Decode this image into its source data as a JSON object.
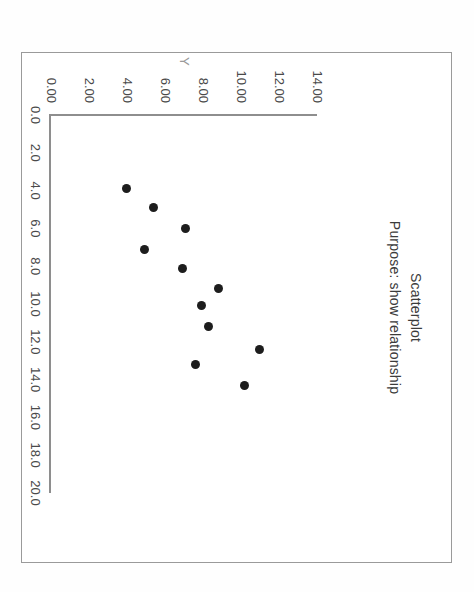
{
  "chart_data": {
    "type": "scatter",
    "title": "Scatterplot",
    "subtitle": "Purpose: show relationship",
    "xlabel": "X",
    "ylabel": "Y",
    "xlim": [
      0.0,
      20.0
    ],
    "ylim": [
      0.0,
      14.0
    ],
    "grid": false,
    "legend": null,
    "xticks": [
      "0.0",
      "2.0",
      "4.0",
      "6.0",
      "8.0",
      "10.0",
      "12.0",
      "14.0",
      "16.0",
      "18.0",
      "20.0"
    ],
    "xtick_values": [
      0,
      2,
      4,
      6,
      8,
      10,
      12,
      14,
      16,
      18,
      20
    ],
    "yticks": [
      "0.00",
      "2.00",
      "4.00",
      "6.00",
      "8.00",
      "10.00",
      "12.00",
      "14.00"
    ],
    "ytick_values": [
      0,
      2,
      4,
      6,
      8,
      10,
      12,
      14
    ],
    "marker": "filled-circle",
    "marker_color": "#1d1d1d",
    "points": [
      {
        "x": 3.9,
        "y": 4.0
      },
      {
        "x": 4.9,
        "y": 5.4
      },
      {
        "x": 6.0,
        "y": 7.1
      },
      {
        "x": 7.1,
        "y": 4.9
      },
      {
        "x": 8.1,
        "y": 6.9
      },
      {
        "x": 9.2,
        "y": 8.8
      },
      {
        "x": 10.1,
        "y": 7.9
      },
      {
        "x": 11.2,
        "y": 8.3
      },
      {
        "x": 12.4,
        "y": 11.0
      },
      {
        "x": 13.2,
        "y": 7.6
      },
      {
        "x": 14.3,
        "y": 10.2
      }
    ]
  },
  "page": {
    "orientation": "rotated-90-clockwise",
    "frame_color": "#9a9a9a",
    "background": "#ffffff"
  }
}
